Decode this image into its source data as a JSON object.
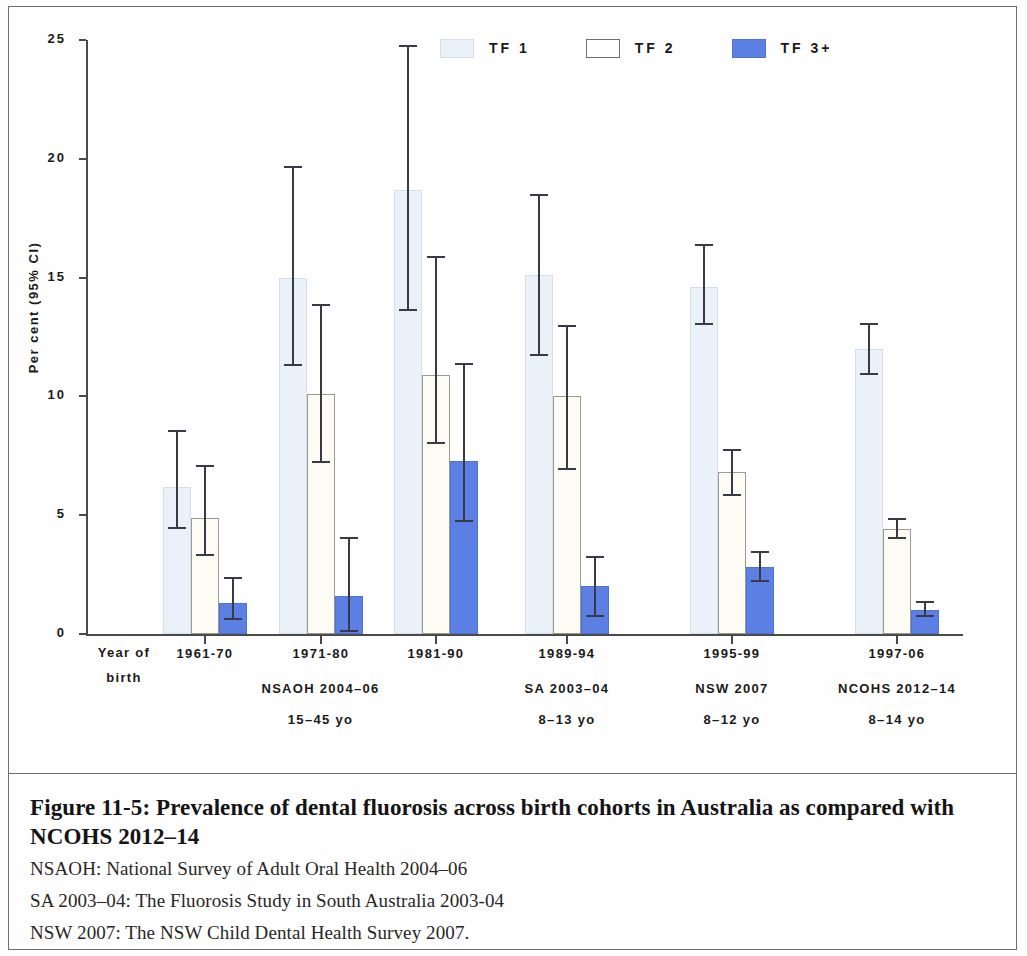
{
  "figure": {
    "caption_title": "Figure 11-5: Prevalence of dental fluorosis across birth cohorts in Australia as compared with NCOHS 2012–14",
    "notes": [
      "NSAOH: National Survey of Adult Oral Health 2004–06",
      "SA 2003–04: The Fluorosis Study in South Australia 2003-04",
      "NSW 2007: The NSW Child Dental Health Survey 2007."
    ]
  },
  "axis": {
    "y_label": "Per cent (95% CI)",
    "y_ticks": [
      "0",
      "5",
      "10",
      "15",
      "20",
      "25"
    ],
    "x_axis_caption_line1": "Year of",
    "x_axis_caption_line2": "birth"
  },
  "legend": {
    "items": [
      {
        "label": "TF 1",
        "key": "tf1",
        "color": "#eaf1f9"
      },
      {
        "label": "TF 2",
        "key": "tf2",
        "color": "#ffffff"
      },
      {
        "label": "TF 3+",
        "key": "tf3",
        "color": "#5b7fe3"
      }
    ]
  },
  "groups": [
    {
      "cohort": "1961-70",
      "survey": "NSAOH 2004–06",
      "age": "15–45 yo"
    },
    {
      "cohort": "1971-80",
      "survey": "",
      "age": ""
    },
    {
      "cohort": "1981-90",
      "survey": "",
      "age": ""
    },
    {
      "cohort": "1989-94",
      "survey": "SA 2003–04",
      "age": "8–13 yo"
    },
    {
      "cohort": "1995-99",
      "survey": "NSW 2007",
      "age": "8–12 yo"
    },
    {
      "cohort": "1997-06",
      "survey": "NCOHS 2012–14",
      "age": "8–14 yo"
    }
  ],
  "chart_data": {
    "type": "bar",
    "title": "Prevalence of dental fluorosis across birth cohorts in Australia as compared with NCOHS 2012–14",
    "xlabel": "Year of birth",
    "ylabel": "Per cent (95% CI)",
    "ylim": [
      0,
      25
    ],
    "yticks": [
      0,
      5,
      10,
      15,
      20,
      25
    ],
    "grid": false,
    "legend_position": "top-center",
    "categories": [
      "1961-70",
      "1971-80",
      "1981-90",
      "1989-94",
      "1995-99",
      "1997-06"
    ],
    "group_surveys": [
      "NSAOH 2004–06",
      "NSAOH 2004–06",
      "NSAOH 2004–06",
      "SA 2003–04",
      "NSW 2007",
      "NCOHS 2012–14"
    ],
    "group_ages": [
      "15–45 yo",
      "15–45 yo",
      "15–45 yo",
      "8–13 yo",
      "8–12 yo",
      "8–14 yo"
    ],
    "series": [
      {
        "name": "TF 1",
        "color": "#eaf1f9",
        "values": [
          6.2,
          15.0,
          18.7,
          15.1,
          14.6,
          12.0
        ],
        "ci_low": [
          4.4,
          11.3,
          13.6,
          11.7,
          13.0,
          10.9
        ],
        "ci_high": [
          8.6,
          19.7,
          24.8,
          18.5,
          16.4,
          13.1
        ]
      },
      {
        "name": "TF 2",
        "color": "#ffffff",
        "values": [
          4.9,
          10.1,
          10.9,
          10.0,
          6.8,
          4.4
        ],
        "ci_low": [
          3.3,
          7.2,
          8.0,
          6.9,
          5.8,
          4.0
        ],
        "ci_high": [
          7.1,
          13.9,
          15.9,
          13.0,
          7.8,
          4.9
        ]
      },
      {
        "name": "TF 3+",
        "color": "#5b7fe3",
        "values": [
          1.3,
          1.6,
          7.3,
          2.0,
          2.8,
          1.0
        ],
        "ci_low": [
          0.6,
          0.1,
          4.7,
          0.7,
          2.2,
          0.7
        ],
        "ci_high": [
          2.4,
          4.1,
          11.4,
          3.3,
          3.5,
          1.4
        ]
      }
    ]
  }
}
